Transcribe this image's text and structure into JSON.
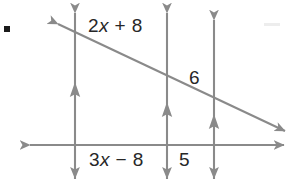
{
  "figure": {
    "background_color": "#ffffff",
    "line_color": "#8a8a8a",
    "text_color": "#272727",
    "bullet_color": "#1b1b1b",
    "labels": {
      "top_segment": {
        "parts": [
          "2",
          "x",
          " + 8"
        ],
        "text": "2x + 8"
      },
      "transversal_segment": {
        "parts": [
          "6"
        ],
        "text": "6"
      },
      "bottom_left_segment": {
        "parts": [
          "3",
          "x",
          " − 8"
        ],
        "text": "3x − 8"
      },
      "bottom_right_segment": {
        "parts": [
          "5"
        ],
        "text": "5"
      }
    },
    "geometry": {
      "vertical_lines": [
        {
          "name": "vertical-line-1",
          "x": 75,
          "y_top": 12,
          "y_bottom": 179,
          "tick_arrow_y": 92
        },
        {
          "name": "vertical-line-2",
          "x": 167,
          "y_top": 12,
          "y_bottom": 179,
          "tick_arrow_y": 112
        },
        {
          "name": "vertical-line-3",
          "x": 214,
          "y_top": 19,
          "y_bottom": 179,
          "tick_arrow_y": 124
        }
      ],
      "horizontal_line": {
        "name": "horizontal-line",
        "y": 145,
        "x_left": 28,
        "x_right": 286
      },
      "transversal": {
        "name": "transversal-line",
        "x1": 56,
        "y1": 23,
        "x2": 287,
        "y2": 132,
        "slope": 0.47
      },
      "intersections": [
        {
          "with": "vertical-line-1",
          "x": 75,
          "y": 32
        },
        {
          "with": "vertical-line-2",
          "x": 167,
          "y": 78
        },
        {
          "with": "vertical-line-3",
          "x": 214,
          "y": 101
        }
      ]
    },
    "marks": {
      "bullet": {
        "name": "problem-bullet",
        "x": 4,
        "y": 26,
        "size": 6
      }
    }
  }
}
